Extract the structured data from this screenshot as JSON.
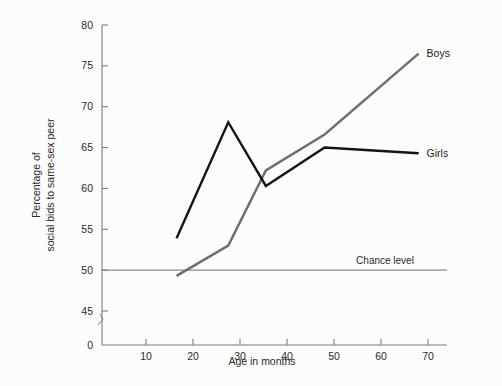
{
  "chart_data": {
    "type": "line",
    "title": "",
    "xlabel": "Age in months",
    "ylabel": "Percentage of social bids to same-sex peer",
    "ylabel_line1": "Percentage of",
    "ylabel_line2": "social bids to same-sex peer",
    "xlim": [
      0,
      75
    ],
    "ylim": [
      42,
      80
    ],
    "y_axis_break": true,
    "y_zero_label": "0",
    "grid": false,
    "legend_position": "inline-right",
    "xticks": [
      10,
      20,
      30,
      40,
      50,
      60,
      70
    ],
    "xtick_labels": [
      "10",
      "20",
      "30",
      "40",
      "50",
      "60",
      "70"
    ],
    "yticks": [
      45,
      50,
      55,
      60,
      65,
      70,
      75,
      80
    ],
    "ytick_labels": [
      "45",
      "50",
      "55",
      "60",
      "65",
      "70",
      "75",
      "80"
    ],
    "annotations": [
      {
        "name": "chance-level",
        "label": "Chance level",
        "y": 50,
        "style": "horizontal-reference-line",
        "color": "#8b8b8b"
      }
    ],
    "series": [
      {
        "name": "Boys",
        "label": "Boys",
        "color": "#6e6e6e",
        "width": 2.4,
        "x": [
          16.5,
          27.5,
          35.5,
          48,
          68
        ],
        "values": [
          49.3,
          53.0,
          62.2,
          66.6,
          76.5
        ]
      },
      {
        "name": "Girls",
        "label": "Girls",
        "color": "#141414",
        "width": 2.4,
        "x": [
          16.5,
          27.5,
          35.5,
          48,
          68
        ],
        "values": [
          53.9,
          68.1,
          60.3,
          65.0,
          64.3
        ]
      }
    ]
  },
  "colors": {
    "background": "#fcfcfb",
    "axis": "#7d7d7d",
    "text": "#2b2b2b",
    "boys": "#6e6e6e",
    "girls": "#141414",
    "chance": "#8b8b8b"
  }
}
